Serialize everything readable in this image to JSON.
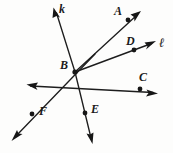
{
  "figure": {
    "type": "geometry-ray-diagram",
    "width": 173,
    "height": 153,
    "background_color": "#fdfdfc",
    "ink_color": "#161616"
  },
  "vertex": {
    "label": "B",
    "x": 75,
    "y": 72,
    "label_x": 60,
    "label_y": 59
  },
  "points": [
    {
      "label": "A",
      "x": 128,
      "y": 20,
      "label_x": 114,
      "label_y": 5
    },
    {
      "label": "D",
      "x": 134,
      "y": 50,
      "label_x": 126,
      "label_y": 35
    },
    {
      "label": "C",
      "x": 140,
      "y": 89,
      "label_x": 139,
      "label_y": 71
    },
    {
      "label": "E",
      "x": 85,
      "y": 113,
      "label_x": 91,
      "label_y": 103
    },
    {
      "label": "F",
      "x": 32,
      "y": 114,
      "label_x": 39,
      "label_y": 105
    }
  ],
  "line_labels": [
    {
      "label": "k",
      "x": 59,
      "y": 3
    },
    {
      "label": "ℓ",
      "x": 159,
      "y": 36
    }
  ],
  "strokes": [
    {
      "name": "ray-k",
      "x1": 75,
      "y1": 72,
      "x2": 56,
      "y2": 12,
      "arrow_end": true
    },
    {
      "name": "ray-BA",
      "x1": 75,
      "y1": 72,
      "x2": 138,
      "y2": 14,
      "arrow_end": true
    },
    {
      "name": "line-l-BD",
      "x1": 75,
      "y1": 72,
      "x2": 153,
      "y2": 43,
      "arrow_end": true
    },
    {
      "name": "line-through-C",
      "x1": 29,
      "y1": 86,
      "x2": 155,
      "y2": 93,
      "arrow_start": true,
      "arrow_end": true
    },
    {
      "name": "line-through-F",
      "x1": 95,
      "y1": 54,
      "x2": 14,
      "y2": 138,
      "arrow_end": true
    },
    {
      "name": "ray-BE",
      "x1": 75,
      "y1": 72,
      "x2": 92,
      "y2": 141,
      "arrow_end": true
    }
  ]
}
